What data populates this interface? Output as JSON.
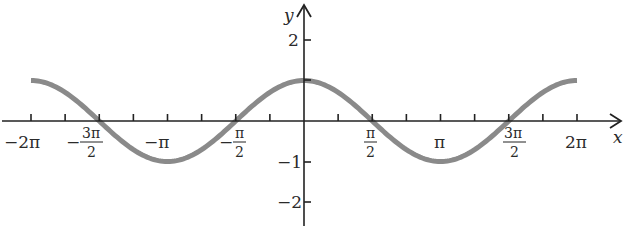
{
  "chart_data": {
    "type": "line",
    "title": "",
    "function": "y = cos(x)",
    "xlabel": "x",
    "ylabel": "y",
    "xlim": [
      -6.2832,
      6.2832
    ],
    "ylim": [
      -2.5,
      2.5
    ],
    "grid": false,
    "legend": null,
    "x_ticks": [
      {
        "value": -6.2832,
        "label_parts": [
          "−2π"
        ],
        "labeled": true
      },
      {
        "value": -5.4978,
        "labeled": false
      },
      {
        "value": -4.7124,
        "label_num": "3π",
        "label_den": "2",
        "sign": "−",
        "labeled": true
      },
      {
        "value": -3.927,
        "labeled": false
      },
      {
        "value": -3.1416,
        "label_parts": [
          "−π"
        ],
        "labeled": true
      },
      {
        "value": -2.3562,
        "labeled": false
      },
      {
        "value": -1.5708,
        "label_num": "π",
        "label_den": "2",
        "sign": "−",
        "labeled": true
      },
      {
        "value": -0.7854,
        "labeled": false
      },
      {
        "value": 0.7854,
        "labeled": false
      },
      {
        "value": 1.5708,
        "label_num": "π",
        "label_den": "2",
        "sign": "",
        "labeled": true
      },
      {
        "value": 2.3562,
        "labeled": false
      },
      {
        "value": 3.1416,
        "label_parts": [
          "π"
        ],
        "labeled": true
      },
      {
        "value": 3.927,
        "labeled": false
      },
      {
        "value": 4.7124,
        "label_num": "3π",
        "label_den": "2",
        "sign": "",
        "labeled": true
      },
      {
        "value": 5.4978,
        "labeled": false
      },
      {
        "value": 6.2832,
        "label_parts": [
          "2π"
        ],
        "labeled": true
      }
    ],
    "y_ticks": [
      {
        "value": 2,
        "label": "2"
      },
      {
        "value": 1,
        "label": ""
      },
      {
        "value": -1,
        "label": "−1"
      },
      {
        "value": -2,
        "label": "−2"
      }
    ],
    "series": [
      {
        "name": "cos(x)",
        "color": "#8a8a8a",
        "x": [
          -6.2832,
          -5.4978,
          -4.7124,
          -3.927,
          -3.1416,
          -2.3562,
          -1.5708,
          -0.7854,
          0,
          0.7854,
          1.5708,
          2.3562,
          3.1416,
          3.927,
          4.7124,
          5.4978,
          6.2832
        ],
        "y": [
          1,
          0.7071,
          0,
          -0.7071,
          -1,
          -0.7071,
          0,
          0.7071,
          1,
          0.7071,
          0,
          -0.7071,
          -1,
          -0.7071,
          0,
          0.7071,
          1
        ]
      }
    ]
  },
  "labels": {
    "x_axis": "x",
    "y_axis": "y",
    "x_neg_2pi": "−2π",
    "x_neg_3pi2_sign": "−",
    "x_neg_3pi2_num": "3π",
    "x_neg_3pi2_den": "2",
    "x_neg_pi": "−π",
    "x_neg_pi2_sign": "−",
    "x_neg_pi2_num": "π",
    "x_neg_pi2_den": "2",
    "x_pi2_num": "π",
    "x_pi2_den": "2",
    "x_pi": "π",
    "x_3pi2_num": "3π",
    "x_3pi2_den": "2",
    "x_2pi": "2π",
    "y_2": "2",
    "y_neg1": "−1",
    "y_neg2": "−2"
  }
}
